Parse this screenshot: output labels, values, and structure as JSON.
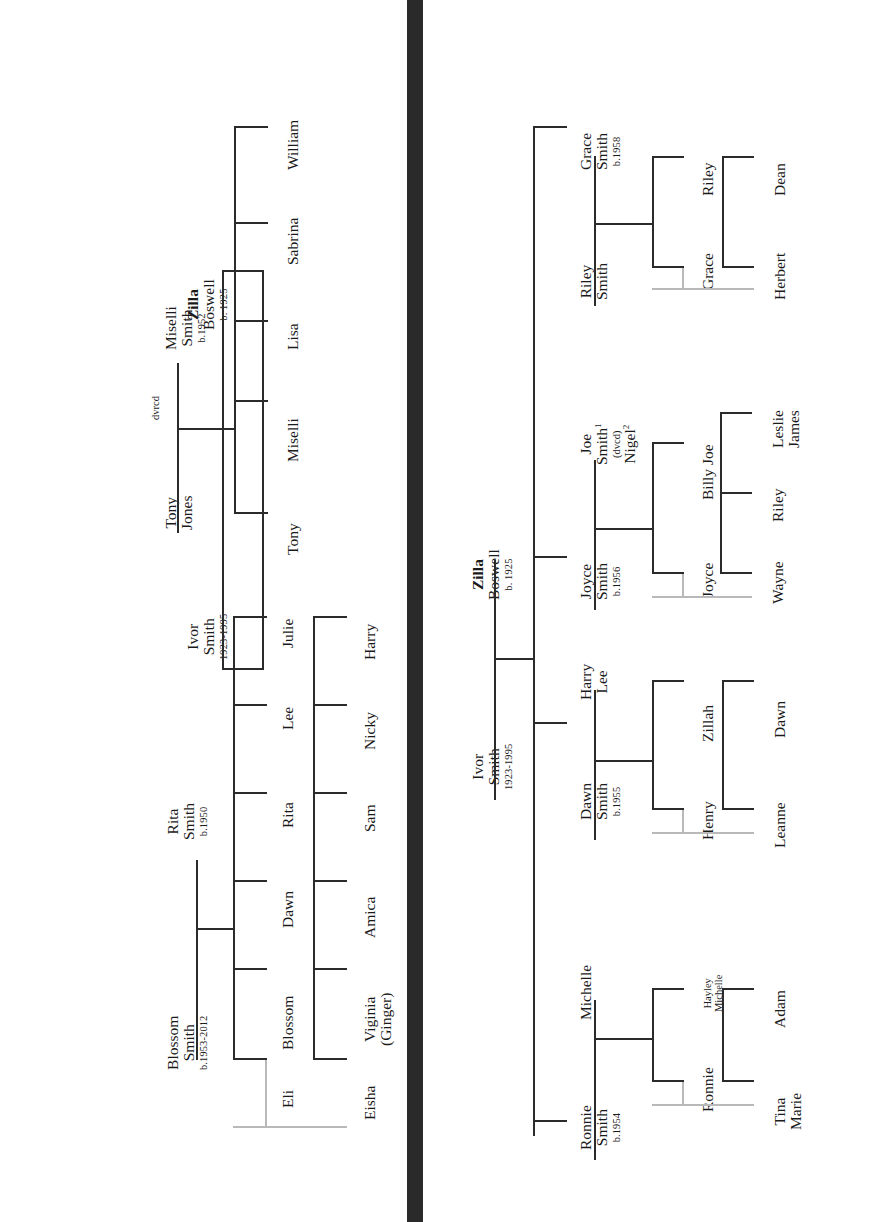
{
  "document": {
    "kind": "family-tree-chart",
    "orientation": "rotated-90-counterclockwise",
    "panel_count": 2,
    "divider": {
      "color": "#2a2a2a"
    }
  },
  "top_chart": {
    "name": "ivor-smith-zilla-boswell-tree-part-1",
    "root": {
      "father": {
        "given": "Ivor",
        "surname": "Smith",
        "years": "1923-1995"
      },
      "mother": {
        "given": "Zilla",
        "surname": "Boswell",
        "years": "b. 1925"
      }
    },
    "couples": [
      {
        "id": "blossom-rita",
        "left": {
          "given": "Blossom",
          "surname": "Smith",
          "years": "b.1953-2012"
        },
        "right": {
          "given": "Rita",
          "surname": "Smith",
          "years": "b.1950"
        },
        "children_row1": [
          "Eli",
          "Blossom",
          "Dawn",
          "Rita",
          "Lee",
          "Julie"
        ],
        "children_row2": [
          "Eisha",
          "Viginia",
          "Amica",
          "Sam",
          "Nicky",
          "Harry"
        ],
        "children_row2_extra": "(Ginger)",
        "partner_link": {
          "from": "Eli",
          "to": "Eisha",
          "color": "#b9b9b9"
        }
      },
      {
        "id": "tony-miselli",
        "left": {
          "given": "Tony",
          "surname": "Jones"
        },
        "right": {
          "given": "Miselli",
          "surname": "Smith",
          "years": "b.1952"
        },
        "status": "dvrcd",
        "children_row1": [
          "Tony",
          "Miselli",
          "Lisa",
          "Sabrina",
          "William"
        ]
      }
    ]
  },
  "bottom_chart": {
    "name": "ivor-smith-zilla-boswell-tree-part-2",
    "root": {
      "father": {
        "given": "Ivor",
        "surname": "Smith",
        "years": "1923-1995"
      },
      "mother": {
        "given": "Zilla",
        "surname": "Boswell",
        "years": "b. 1925"
      }
    },
    "couples": [
      {
        "id": "ronnie-michelle",
        "left": {
          "given": "Ronnie",
          "surname": "Smith",
          "years": "b.1954"
        },
        "right": {
          "given": "Michelle"
        },
        "children_row1": [
          "Ronnie",
          "Hayley"
        ],
        "children_row1b": [
          "",
          "Michelle"
        ],
        "children_row2": [
          "Tina",
          "Adam"
        ],
        "children_row2b": [
          "Marie",
          ""
        ],
        "partner_link": {
          "from": "Ronnie",
          "to": "Tina Marie",
          "color": "#b9b9b9"
        }
      },
      {
        "id": "dawn-harry",
        "left": {
          "given": "Dawn",
          "surname": "Smith",
          "years": "b.1955"
        },
        "right": {
          "given": "Harry",
          "surname": "Lee"
        },
        "children_row1": [
          "Henry",
          "Zillah"
        ],
        "children_row2": [
          "Leanne",
          "Dawn"
        ],
        "partner_link": {
          "from": "Henry",
          "to": "Leanne",
          "color": "#b9b9b9"
        }
      },
      {
        "id": "joyce-joe",
        "left": {
          "given": "Joyce",
          "surname": "Smith",
          "years": "b.1956"
        },
        "right": {
          "given": "Joe",
          "surname": "Smith",
          "surname_sup": "1",
          "status": "(dvcd)",
          "second": "Nigel",
          "second_sup": "2"
        },
        "children_row1": [
          "Joyce",
          "Billy Joe"
        ],
        "children_row2": [
          "Wayne",
          "Riley",
          "Leslie"
        ],
        "children_row2b": [
          "",
          "",
          "James"
        ],
        "partner_link": {
          "from": "Joyce",
          "to": "Wayne",
          "color": "#b9b9b9"
        }
      },
      {
        "id": "grace-riley",
        "left": {
          "given": "Riley",
          "surname": "Smith"
        },
        "right": {
          "given": "Grace",
          "surname": "Smith",
          "years": "b.1958"
        },
        "children_row1": [
          "Grace",
          "Riley"
        ],
        "children_row2": [
          "Herbert",
          "Dean"
        ],
        "partner_link": {
          "from": "Grace",
          "to": "Herbert",
          "color": "#b9b9b9"
        }
      }
    ]
  },
  "labels": {
    "ivor_given": "Ivor",
    "ivor_surname": "Smith",
    "ivor_years": "1923-1995",
    "zilla_given": "Zilla",
    "zilla_surname": "Boswell",
    "zilla_years": "b. 1925",
    "blossom_given": "Blossom",
    "blossom_surname": "Smith",
    "blossom_years": "b.1953-2012",
    "rita_given": "Rita",
    "rita_surname": "Smith",
    "rita_years": "b.1950",
    "tony_given": "Tony",
    "tony_surname": "Jones",
    "dvrcd": "dvrcd",
    "miselli_given": "Miselli",
    "miselli_surname": "Smith",
    "miselli_years": "b.1952",
    "t_c1": "Eli",
    "t_c2": "Blossom",
    "t_c3": "Dawn",
    "t_c4": "Rita",
    "t_c5": "Lee",
    "t_c6": "Julie",
    "t_d1a": "Eisha",
    "t_d2a": "Viginia",
    "t_d2b": "(Ginger)",
    "t_d3a": "Amica",
    "t_d4a": "Sam",
    "t_d5a": "Nicky",
    "t_d6a": "Harry",
    "m_c1": "Tony",
    "m_c2": "Miselli",
    "m_c3": "Lisa",
    "m_c4": "Sabrina",
    "m_c5": "William",
    "ronnie_given": "Ronnie",
    "ronnie_surname": "Smith",
    "ronnie_years": "b.1954",
    "michelle_given": "Michelle",
    "r_c1": "Ronnie",
    "r_c2a": "Hayley",
    "r_c2b": "Michelle",
    "r_d1a": "Tina",
    "r_d1b": "Marie",
    "r_d2a": "Adam",
    "dawn_given": "Dawn",
    "dawn_surname": "Smith",
    "dawn_years": "b.1955",
    "harry_given": "Harry",
    "harry_surname": "Lee",
    "d_c1": "Henry",
    "d_c2": "Zillah",
    "d_d1": "Leanne",
    "d_d2": "Dawn",
    "joyce_given": "Joyce",
    "joyce_surname": "Smith",
    "joyce_years": "b.1956",
    "joe_given": "Joe",
    "joe_surname": "Smith",
    "joe_sup": "1",
    "joe_status": "(dvcd)",
    "nigel": "Nigel",
    "nigel_sup": "2",
    "j_c1": "Joyce",
    "j_c2": "Billy Joe",
    "j_d1": "Wayne",
    "j_d2": "Riley",
    "j_d3a": "Leslie",
    "j_d3b": "James",
    "riley_given": "Riley",
    "riley_surname": "Smith",
    "grace_given": "Grace",
    "grace_surname": "Smith",
    "grace_years": "b.1958",
    "g_c1": "Grace",
    "g_c2": "Riley",
    "g_d1": "Herbert",
    "g_d2": "Dean"
  }
}
